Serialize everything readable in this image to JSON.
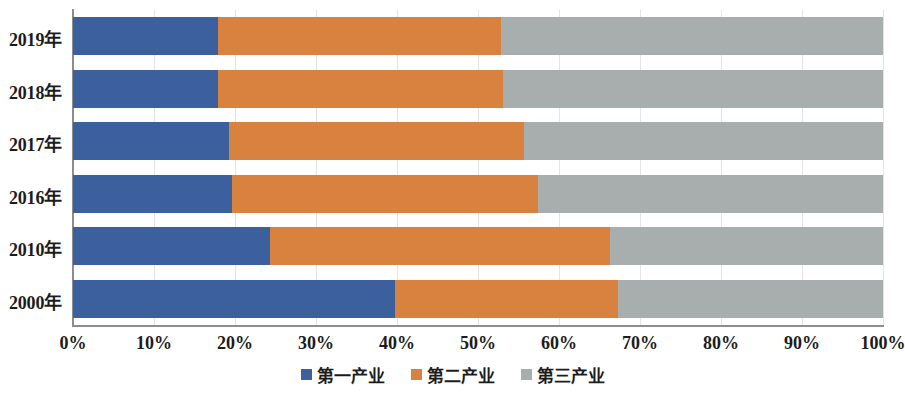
{
  "chart_data": {
    "type": "bar",
    "orientation": "horizontal",
    "stacked": true,
    "normalized": true,
    "title": "",
    "subtitle": "",
    "xlabel": "",
    "ylabel": "",
    "xlim": [
      0,
      100
    ],
    "grid": true,
    "legend_position": "bottom",
    "categories": [
      "2019年",
      "2018年",
      "2017年",
      "2016年",
      "2010年",
      "2000年"
    ],
    "xtick_labels": [
      "0%",
      "10%",
      "20%",
      "30%",
      "40%",
      "50%",
      "60%",
      "70%",
      "80%",
      "90%",
      "100%"
    ],
    "xtick_values": [
      0,
      10,
      20,
      30,
      40,
      50,
      60,
      70,
      80,
      90,
      100
    ],
    "series": [
      {
        "name": "第一产业",
        "color": "#3c5f9e",
        "values": [
          17.9,
          17.9,
          19.3,
          19.6,
          24.3,
          39.8
        ]
      },
      {
        "name": "第二产业",
        "color": "#d9813f",
        "values": [
          34.9,
          35.2,
          36.4,
          37.8,
          42.0,
          27.5
        ]
      },
      {
        "name": "第三产业",
        "color": "#a8adad",
        "values": [
          47.2,
          46.9,
          44.3,
          42.6,
          33.7,
          32.7
        ]
      }
    ],
    "cumulative_boundaries": [
      [
        17.9,
        52.8
      ],
      [
        17.9,
        53.1
      ],
      [
        19.3,
        55.7
      ],
      [
        19.6,
        57.4
      ],
      [
        24.3,
        66.3
      ],
      [
        39.8,
        67.3
      ]
    ]
  },
  "legend": {
    "items": [
      {
        "label": "第一产业",
        "color": "#3c5f9e"
      },
      {
        "label": "第二产业",
        "color": "#d9813f"
      },
      {
        "label": "第三产业",
        "color": "#a8adad"
      }
    ]
  },
  "colors": {
    "primary": "#3c5f9e",
    "secondary": "#d9813f",
    "tertiary": "#a8adad",
    "axis": "#8d8d8d",
    "grid": "#e4e4e4",
    "text": "#1c1c1c",
    "background": "#ffffff"
  }
}
